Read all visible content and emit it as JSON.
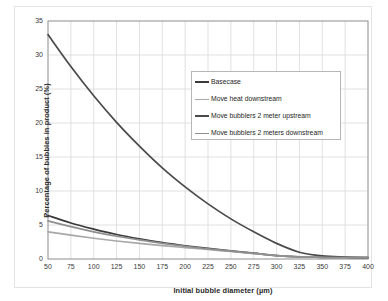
{
  "chart_data": {
    "type": "line",
    "title": "",
    "xlabel": "Initial bubble diameter (µm)",
    "ylabel": "Percentage of bubbles in product (%)",
    "xlim": [
      50,
      400
    ],
    "ylim": [
      0,
      35
    ],
    "xticks": [
      50,
      75,
      100,
      125,
      150,
      175,
      200,
      225,
      250,
      275,
      300,
      325,
      350,
      375,
      400
    ],
    "yticks": [
      0,
      5,
      10,
      15,
      20,
      25,
      30,
      35
    ],
    "grid": true,
    "legend_position": "upper-right-inside",
    "x": [
      50,
      75,
      100,
      125,
      150,
      175,
      200,
      225,
      250,
      275,
      300,
      325,
      350,
      375,
      400
    ],
    "series": [
      {
        "name": "Basecase",
        "color": "#3a3a3a",
        "values": [
          6.4,
          5.3,
          4.4,
          3.6,
          2.95,
          2.4,
          1.95,
          1.55,
          1.2,
          0.85,
          0.5,
          0.3,
          0.25,
          0.22,
          0.2
        ]
      },
      {
        "name": "Move heat downstream",
        "color": "#a8a8a8",
        "values": [
          4.0,
          3.5,
          3.05,
          2.65,
          2.3,
          1.98,
          1.68,
          1.4,
          1.1,
          0.8,
          0.5,
          0.3,
          0.25,
          0.22,
          0.2
        ]
      },
      {
        "name": "Move bubblers 2 meter upstream",
        "color": "#4a4a4a",
        "values": [
          33.0,
          28.3,
          24.0,
          20.1,
          16.6,
          13.4,
          10.6,
          8.1,
          5.9,
          4.0,
          2.3,
          1.0,
          0.45,
          0.28,
          0.2
        ]
      },
      {
        "name": "Move bubblers 2 meters downstream",
        "color": "#8f8f8f",
        "values": [
          5.6,
          4.75,
          4.0,
          3.35,
          2.8,
          2.3,
          1.88,
          1.5,
          1.15,
          0.83,
          0.5,
          0.3,
          0.25,
          0.22,
          0.2
        ]
      }
    ]
  },
  "legend": {
    "entries": [
      {
        "label": "Basecase"
      },
      {
        "label": "Move heat downstream"
      },
      {
        "label": "Move bubblers 2 meter upstream"
      },
      {
        "label": "Move bubblers 2 meters downstream"
      }
    ]
  },
  "colors": {
    "grid": "#d9d9d9",
    "axis": "#9a9a9a",
    "plot_background": "#ffffff",
    "figure_background": "#ffffff",
    "text": "#2a2a2a"
  }
}
